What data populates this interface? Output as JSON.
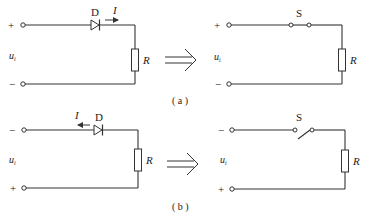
{
  "figure": {
    "colors": {
      "line": "#333333",
      "background": "#ffffff",
      "text": "#222222"
    },
    "equivalence_arrow": "double-arrow-implies",
    "panels": [
      {
        "id": "a",
        "caption": "( a )",
        "left_circuit": {
          "top_terminal": "+",
          "bottom_terminal": "−",
          "source_label": "u",
          "source_sub": "i",
          "diode_label": "D",
          "current_label": "I",
          "current_direction": "right",
          "resistor_label": "R"
        },
        "right_circuit": {
          "top_terminal": "+",
          "bottom_terminal": "−",
          "source_label": "u",
          "source_sub": "i",
          "switch_label": "S",
          "switch_state": "closed",
          "resistor_label": "R"
        }
      },
      {
        "id": "b",
        "caption": "( b )",
        "left_circuit": {
          "top_terminal": "−",
          "bottom_terminal": "+",
          "source_label": "u",
          "source_sub": "i",
          "diode_label": "D",
          "current_label": "I",
          "current_direction": "left",
          "resistor_label": "R"
        },
        "right_circuit": {
          "top_terminal": "−",
          "bottom_terminal": "+",
          "source_label": "u",
          "source_sub": "i",
          "switch_label": "S",
          "switch_state": "open",
          "resistor_label": "R"
        }
      }
    ]
  }
}
